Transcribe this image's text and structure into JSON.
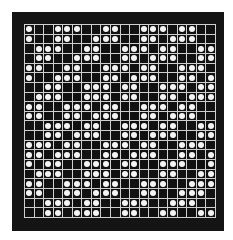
{
  "pattern": {
    "rows": 20,
    "cols": 20,
    "colors": {
      "frame": "#141414",
      "cell": "#111111",
      "gridline": "#cfcfcf",
      "dot": "#f4f4f4",
      "background": "#ffffff"
    },
    "filled": [
      [
        0,
        3,
        4,
        5,
        8,
        9,
        12,
        13,
        14,
        16,
        17
      ],
      [
        0,
        3,
        4,
        7,
        8,
        9,
        12,
        13,
        15,
        16,
        17
      ],
      [
        1,
        2,
        3,
        6,
        7,
        10,
        11,
        12,
        14,
        15,
        18,
        19
      ],
      [
        1,
        2,
        5,
        6,
        7,
        10,
        11,
        13,
        14,
        15,
        18,
        19
      ],
      [
        0,
        1,
        4,
        5,
        8,
        9,
        10,
        12,
        13,
        16,
        17,
        18
      ],
      [
        0,
        3,
        4,
        5,
        8,
        9,
        11,
        12,
        13,
        16,
        17,
        19
      ],
      [
        2,
        3,
        6,
        7,
        8,
        10,
        11,
        14,
        15,
        16,
        18,
        19
      ],
      [
        1,
        2,
        3,
        6,
        7,
        8,
        10,
        11,
        14,
        15,
        17,
        18,
        19
      ],
      [
        0,
        1,
        4,
        5,
        6,
        8,
        9,
        12,
        13,
        14,
        16,
        17
      ],
      [
        0,
        1,
        4,
        5,
        7,
        8,
        9,
        12,
        13,
        15,
        16,
        17
      ],
      [
        2,
        3,
        4,
        6,
        7,
        10,
        11,
        12,
        14,
        15,
        18,
        19
      ],
      [
        2,
        3,
        5,
        6,
        7,
        10,
        11,
        13,
        14,
        15,
        18,
        19
      ],
      [
        0,
        1,
        2,
        4,
        5,
        8,
        9,
        10,
        12,
        13,
        16,
        17,
        18
      ],
      [
        0,
        1,
        3,
        4,
        5,
        8,
        9,
        11,
        12,
        13,
        16,
        17,
        19
      ],
      [
        0,
        2,
        3,
        6,
        7,
        8,
        10,
        11,
        14,
        15,
        16,
        19
      ],
      [
        1,
        2,
        3,
        6,
        7,
        8,
        10,
        11,
        14,
        15,
        18,
        19
      ],
      [
        0,
        1,
        4,
        5,
        6,
        8,
        9,
        12,
        13,
        14,
        17,
        18,
        19
      ],
      [
        0,
        1,
        4,
        5,
        7,
        8,
        9,
        12,
        13,
        16,
        17,
        18
      ],
      [
        2,
        3,
        4,
        6,
        7,
        10,
        11,
        12,
        15,
        16,
        17
      ],
      [
        2,
        3,
        5,
        6,
        7,
        10,
        11,
        14,
        15,
        18,
        19
      ]
    ]
  }
}
